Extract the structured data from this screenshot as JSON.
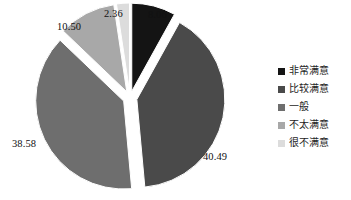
{
  "chart_data": {
    "type": "pie",
    "title": "",
    "exploded": true,
    "start_angle_deg": 0,
    "direction": "clockwise",
    "categories": [
      "非常满意",
      "比较满意",
      "一般",
      "不太满意",
      "很不满意"
    ],
    "values": [
      8.06,
      40.49,
      38.58,
      10.5,
      2.36
    ],
    "labels": [
      "8.06",
      "40.49",
      "38.58",
      "10.50",
      "2.36"
    ],
    "colors": [
      "#141414",
      "#4a4a4a",
      "#6e6e6e",
      "#a8a8a8",
      "#dcdcdc"
    ],
    "legend_position": "right",
    "grid": false,
    "slices": [
      {
        "label": "非常满意",
        "value": 8.06,
        "value_text": "8.06",
        "color": "#141414"
      },
      {
        "label": "比较满意",
        "value": 40.49,
        "value_text": "40.49",
        "color": "#4a4a4a"
      },
      {
        "label": "一般",
        "value": 38.58,
        "value_text": "38.58",
        "color": "#6e6e6e"
      },
      {
        "label": "不太满意",
        "value": 10.5,
        "value_text": "10.50",
        "color": "#a8a8a8"
      },
      {
        "label": "很不满意",
        "value": 2.36,
        "value_text": "2.36",
        "color": "#dcdcdc"
      }
    ]
  },
  "legend": {
    "items": [
      {
        "label": "非常满意",
        "color": "#141414"
      },
      {
        "label": "比较满意",
        "color": "#4a4a4a"
      },
      {
        "label": "一般",
        "color": "#6e6e6e"
      },
      {
        "label": "不太满意",
        "color": "#a8a8a8"
      },
      {
        "label": "很不满意",
        "color": "#dcdcdc"
      }
    ]
  },
  "data_labels": [
    {
      "text": "8.06",
      "x": 148,
      "y": 10
    },
    {
      "text": "40.49",
      "x": 203,
      "y": 152
    },
    {
      "text": "38.58",
      "x": 12,
      "y": 139
    },
    {
      "text": "10.50",
      "x": 57,
      "y": 22
    },
    {
      "text": "2.36",
      "x": 104,
      "y": 9
    }
  ]
}
